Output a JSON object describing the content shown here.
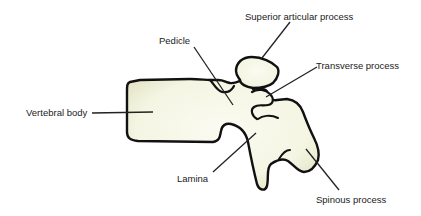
{
  "diagram": {
    "type": "anatomical-labeled-illustration",
    "colors": {
      "bone_fill": "#f7f7e8",
      "bone_shadow": "#e3e5c6",
      "outline": "#111111",
      "leader_line": "#222222",
      "text": "#222222",
      "background": "#ffffff"
    },
    "labels": {
      "vertebral_body": "Vertebral body",
      "pedicle": "Pedicle",
      "superior_articular_process": "Superior articular process",
      "transverse_process": "Transverse process",
      "lamina": "Lamina",
      "spinous_process": "Spinous process"
    }
  }
}
